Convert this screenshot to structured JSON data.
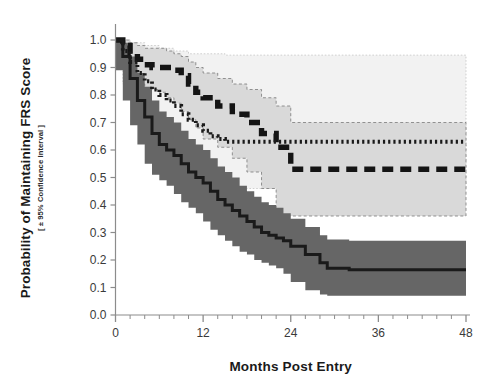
{
  "chart_data": {
    "type": "line",
    "title": "",
    "subtitle": "",
    "xlabel": "Months Post Entry",
    "ylabel": "Probability of Maintaining FRS Score",
    "ylabel_sub": "[ ± 95% Confidence Interval ]",
    "xlim": [
      0,
      48
    ],
    "ylim": [
      0.0,
      1.0
    ],
    "xticks": [
      0,
      12,
      24,
      36,
      48
    ],
    "xtick_labels": [
      "0",
      "12",
      "24",
      "36",
      "48"
    ],
    "x_minor_tick_interval": 2,
    "yticks": [
      0.0,
      0.1,
      0.2,
      0.3,
      0.4,
      0.5,
      0.6,
      0.7,
      0.8,
      0.9,
      1.0
    ],
    "ytick_labels": [
      "0.0",
      "0.1",
      "0.2",
      "0.3",
      "0.4",
      "0.5",
      "0.6",
      "0.7",
      "0.8",
      "0.9",
      "1.0"
    ],
    "grid": false,
    "legend_position": "none",
    "colors": {
      "solid_line": "#1a1a1a",
      "dotted_line": "#1a1a1a",
      "dashed_line": "#141414",
      "solid_band": "#666666",
      "dotted_band": "#f2f2f2",
      "dashed_band": "#d9d9d9",
      "axis": "#8c8c8c",
      "text": "#1a1a1a"
    },
    "series": [
      {
        "name": "Upper curve (thick dashed)",
        "style": "dashed",
        "plateau_value": 0.53,
        "plateau_start_month": 24,
        "x": [
          0,
          1,
          2,
          3,
          4,
          5,
          6,
          7,
          8,
          9,
          10,
          11,
          12,
          14,
          16,
          18,
          20,
          22,
          24,
          28,
          32,
          36,
          40,
          44,
          48
        ],
        "values": [
          1.0,
          0.98,
          0.95,
          0.93,
          0.91,
          0.9,
          0.9,
          0.9,
          0.89,
          0.87,
          0.84,
          0.81,
          0.79,
          0.76,
          0.73,
          0.7,
          0.66,
          0.61,
          0.53,
          0.53,
          0.53,
          0.53,
          0.53,
          0.53,
          0.53
        ],
        "ci_upper": [
          1.0,
          1.0,
          0.99,
          0.98,
          0.97,
          0.97,
          0.97,
          0.96,
          0.95,
          0.94,
          0.92,
          0.9,
          0.88,
          0.86,
          0.84,
          0.82,
          0.79,
          0.76,
          0.7,
          0.7,
          0.7,
          0.7,
          0.7,
          0.7,
          0.7
        ],
        "ci_lower": [
          1.0,
          0.95,
          0.9,
          0.87,
          0.84,
          0.82,
          0.82,
          0.81,
          0.79,
          0.77,
          0.74,
          0.71,
          0.68,
          0.64,
          0.61,
          0.57,
          0.52,
          0.46,
          0.36,
          0.36,
          0.36,
          0.36,
          0.36,
          0.36,
          0.36
        ]
      },
      {
        "name": "Middle curve (fine dotted)",
        "style": "dotted",
        "plateau_value": 0.63,
        "plateau_start_month": 15,
        "x": [
          0,
          1,
          2,
          3,
          4,
          5,
          6,
          7,
          8,
          9,
          10,
          11,
          12,
          13,
          14,
          15,
          18,
          24,
          30,
          36,
          42,
          48
        ],
        "values": [
          1.0,
          0.96,
          0.92,
          0.88,
          0.85,
          0.82,
          0.8,
          0.78,
          0.76,
          0.73,
          0.71,
          0.69,
          0.67,
          0.65,
          0.64,
          0.63,
          0.63,
          0.63,
          0.63,
          0.63,
          0.63,
          0.63
        ],
        "ci_upper": [
          1.0,
          1.0,
          0.99,
          0.99,
          0.98,
          0.98,
          0.97,
          0.97,
          0.96,
          0.96,
          0.95,
          0.95,
          0.95,
          0.95,
          0.95,
          0.945,
          0.945,
          0.945,
          0.945,
          0.945,
          0.945,
          0.945
        ],
        "ci_lower": [
          1.0,
          0.91,
          0.84,
          0.79,
          0.74,
          0.7,
          0.67,
          0.64,
          0.61,
          0.58,
          0.55,
          0.52,
          0.5,
          0.48,
          0.47,
          0.46,
          0.46,
          0.46,
          0.46,
          0.46,
          0.46,
          0.46
        ]
      },
      {
        "name": "Lower curve (solid)",
        "style": "solid",
        "plateau_value": 0.165,
        "plateau_start_month": 29,
        "x": [
          0,
          1,
          2,
          3,
          4,
          5,
          6,
          7,
          8,
          9,
          10,
          11,
          12,
          13,
          14,
          15,
          16,
          17,
          18,
          19,
          20,
          21,
          22,
          23,
          24,
          26,
          28,
          29,
          32,
          36,
          40,
          44,
          48
        ],
        "values": [
          1.0,
          0.94,
          0.86,
          0.78,
          0.72,
          0.66,
          0.62,
          0.6,
          0.58,
          0.55,
          0.52,
          0.5,
          0.48,
          0.45,
          0.42,
          0.4,
          0.38,
          0.36,
          0.34,
          0.32,
          0.3,
          0.29,
          0.28,
          0.27,
          0.25,
          0.22,
          0.19,
          0.17,
          0.165,
          0.165,
          0.165,
          0.165,
          0.165
        ],
        "ci_upper": [
          1.0,
          0.99,
          0.94,
          0.88,
          0.83,
          0.78,
          0.74,
          0.72,
          0.7,
          0.67,
          0.64,
          0.62,
          0.6,
          0.57,
          0.54,
          0.52,
          0.5,
          0.47,
          0.45,
          0.43,
          0.41,
          0.4,
          0.39,
          0.37,
          0.35,
          0.32,
          0.29,
          0.275,
          0.27,
          0.27,
          0.27,
          0.27,
          0.27
        ],
        "ci_lower": [
          1.0,
          0.89,
          0.78,
          0.69,
          0.62,
          0.55,
          0.51,
          0.49,
          0.47,
          0.44,
          0.41,
          0.39,
          0.37,
          0.34,
          0.31,
          0.29,
          0.27,
          0.25,
          0.23,
          0.22,
          0.2,
          0.19,
          0.18,
          0.17,
          0.15,
          0.12,
          0.09,
          0.075,
          0.07,
          0.07,
          0.07,
          0.07,
          0.07
        ]
      }
    ]
  }
}
